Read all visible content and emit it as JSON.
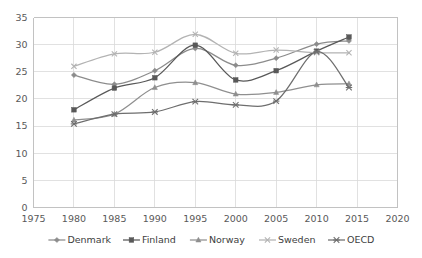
{
  "chart_data": {
    "type": "line",
    "title": "",
    "xlabel": "",
    "ylabel": "",
    "xlim": [
      1975,
      2020
    ],
    "ylim": [
      0,
      35
    ],
    "x": [
      1980,
      1985,
      1990,
      1995,
      2000,
      2005,
      2010,
      2014
    ],
    "x_ticks": [
      "1975",
      "1980",
      "1985",
      "1990",
      "1995",
      "2000",
      "2005",
      "2010",
      "2015",
      "2020"
    ],
    "x_tick_values": [
      1975,
      1980,
      1985,
      1990,
      1995,
      2000,
      2005,
      2010,
      2015,
      2020
    ],
    "y_ticks": [
      "0",
      "5",
      "10",
      "15",
      "20",
      "25",
      "30",
      "35"
    ],
    "y_tick_values": [
      0,
      5,
      10,
      15,
      20,
      25,
      30,
      35
    ],
    "grid": true,
    "smooth": true,
    "legend_position": "bottom",
    "series": [
      {
        "name": "Denmark",
        "marker": "diamond",
        "color": "#8c8c8c",
        "values": [
          24.4,
          22.7,
          25.2,
          29.3,
          26.2,
          27.5,
          30.1,
          30.7
        ]
      },
      {
        "name": "Finland",
        "marker": "square",
        "color": "#595959",
        "values": [
          18.0,
          22.0,
          23.9,
          29.9,
          23.5,
          25.2,
          28.8,
          31.4
        ]
      },
      {
        "name": "Norway",
        "marker": "triangle",
        "color": "#8f8f8f",
        "values": [
          16.1,
          17.2,
          22.1,
          23.0,
          20.9,
          21.2,
          22.6,
          22.8
        ]
      },
      {
        "name": "Sweden",
        "marker": "cross",
        "color": "#b3b3b3",
        "values": [
          26.0,
          28.3,
          28.6,
          31.9,
          28.4,
          29.0,
          28.5,
          28.5
        ]
      },
      {
        "name": "OECD",
        "marker": "asterisk",
        "color": "#6e6e6e",
        "values": [
          15.4,
          17.2,
          17.6,
          19.5,
          18.9,
          19.6,
          28.7,
          22.1
        ]
      }
    ]
  },
  "legend": {
    "items": [
      {
        "label": "Denmark"
      },
      {
        "label": "Finland"
      },
      {
        "label": "Norway"
      },
      {
        "label": "Sweden"
      },
      {
        "label": "OECD"
      }
    ]
  }
}
